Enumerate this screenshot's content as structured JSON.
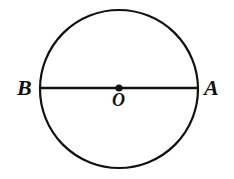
{
  "figure": {
    "type": "geometry-diagram",
    "canvas": {
      "width": 234,
      "height": 179,
      "background": "#ffffff"
    },
    "stroke_color": "#111111",
    "shapes": {
      "circle": {
        "name": "circle",
        "center_x": 119,
        "center_y": 89,
        "radius": 79,
        "stroke_width": 2.2,
        "fill": "none"
      },
      "diameter": {
        "name": "diameter-AB",
        "x1": 40,
        "y1": 88,
        "x2": 199,
        "y2": 88,
        "stroke_width": 2.4
      },
      "center_point": {
        "name": "center-point-O",
        "cx": 119,
        "cy": 88,
        "r": 3.6,
        "fill": "#111111"
      }
    },
    "labels": {
      "left_endpoint": "B",
      "right_endpoint": "A",
      "center": "O"
    }
  }
}
